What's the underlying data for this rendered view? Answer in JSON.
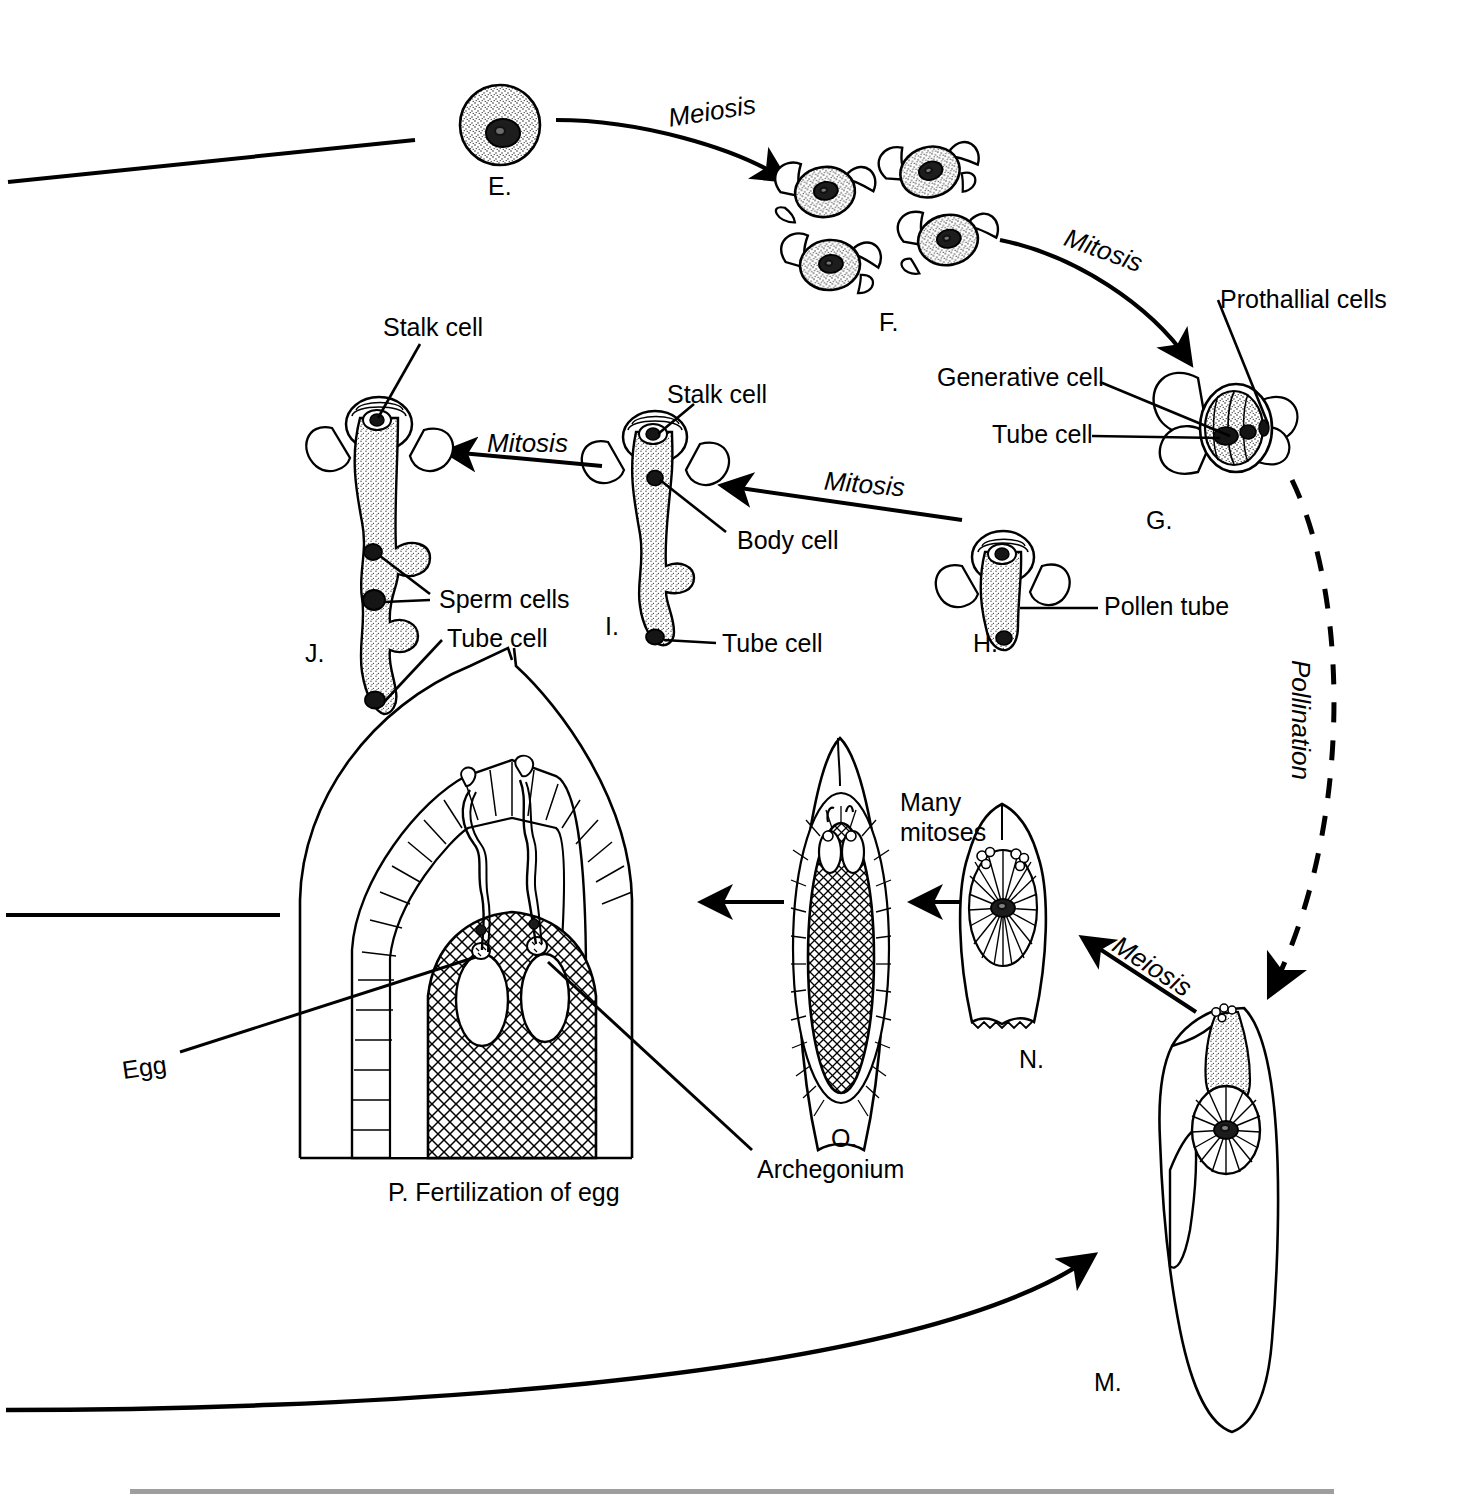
{
  "diagram": {
    "ink_color": "#000000",
    "background": "#ffffff",
    "stage_labels": [
      {
        "id": "E",
        "text": "E."
      },
      {
        "id": "F",
        "text": "F."
      },
      {
        "id": "G",
        "text": "G."
      },
      {
        "id": "H",
        "text": "H."
      },
      {
        "id": "I",
        "text": "I."
      },
      {
        "id": "J",
        "text": "J."
      },
      {
        "id": "M",
        "text": "M."
      },
      {
        "id": "N",
        "text": "N."
      },
      {
        "id": "O",
        "text": "O."
      },
      {
        "id": "P",
        "text": "P. Fertilization of egg"
      }
    ],
    "process_labels": [
      {
        "name": "meiosis-top",
        "text": "Meiosis"
      },
      {
        "name": "mitosis-top-right",
        "text": "Mitosis"
      },
      {
        "name": "mitosis-middle-left",
        "text": "Mitosis"
      },
      {
        "name": "mitosis-middle-right",
        "text": "Mitosis"
      },
      {
        "name": "pollination",
        "text": "Pollination"
      },
      {
        "name": "meiosis-bottom-right",
        "text": "Meiosis"
      },
      {
        "name": "many-mitoses",
        "line1": "Many",
        "line2": "mitoses"
      }
    ],
    "part_labels": [
      {
        "name": "stalk-cell-j",
        "text": "Stalk cell"
      },
      {
        "name": "stalk-cell-i",
        "text": "Stalk cell"
      },
      {
        "name": "sperm-cells",
        "text": "Sperm cells"
      },
      {
        "name": "tube-cell-j",
        "text": "Tube cell"
      },
      {
        "name": "tube-cell-i",
        "text": "Tube cell"
      },
      {
        "name": "body-cell",
        "text": "Body cell"
      },
      {
        "name": "prothallial-cells",
        "text": "Prothallial cells"
      },
      {
        "name": "generative-cell",
        "text": "Generative cell"
      },
      {
        "name": "tube-cell-g",
        "text": "Tube cell"
      },
      {
        "name": "pollen-tube",
        "text": "Pollen tube"
      },
      {
        "name": "egg",
        "text": "Egg"
      },
      {
        "name": "archegonium",
        "text": "Archegonium"
      }
    ]
  }
}
